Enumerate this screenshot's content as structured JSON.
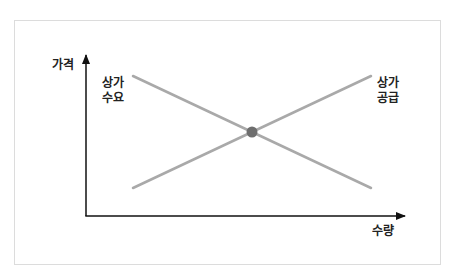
{
  "diagram": {
    "y_axis_label": "가격",
    "x_axis_label": "수량",
    "demand_label_line1": "상가",
    "demand_label_line2": "수요",
    "supply_label_line1": "상가",
    "supply_label_line2": "공급",
    "colors": {
      "axis": "#111111",
      "curve": "#a9a9a9",
      "equilibrium_point": "#6e6e6e",
      "frame_border": "#dcdcdc"
    }
  }
}
